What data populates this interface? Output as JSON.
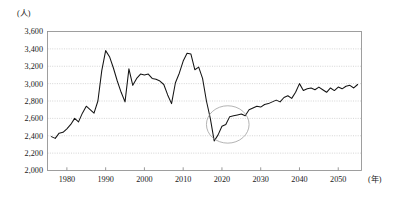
{
  "chart": {
    "y_axis_title": "(人)",
    "x_axis_title": "(年)"
  },
  "chart_data": {
    "type": "line",
    "title": "",
    "subtitle": "",
    "xlabel": "(年)",
    "ylabel": "(人)",
    "xlim": [
      1975,
      2056
    ],
    "ylim": [
      2000,
      3600
    ],
    "ytick_step": 200,
    "grid": true,
    "legend": false,
    "legend_position": "none",
    "ytick_labels": [
      "2,000",
      "2,200",
      "2,400",
      "2,600",
      "2,800",
      "3,000",
      "3,200",
      "3,400",
      "3,600"
    ],
    "ytick_values": [
      2000,
      2200,
      2400,
      2600,
      2800,
      3000,
      3200,
      3400,
      3600
    ],
    "xtick_labels": [
      "1980",
      "1990",
      "2000",
      "2010",
      "2020",
      "2030",
      "2040",
      "2050"
    ],
    "xtick_values": [
      1980,
      1990,
      2000,
      2010,
      2020,
      2030,
      2040,
      2050
    ],
    "series": [
      {
        "name": "人数",
        "color": "#141414",
        "x": [
          1976,
          1977,
          1978,
          1979,
          1980,
          1981,
          1982,
          1983,
          1984,
          1985,
          1986,
          1987,
          1988,
          1989,
          1990,
          1991,
          1992,
          1993,
          1994,
          1995,
          1996,
          1997,
          1998,
          1999,
          2000,
          2001,
          2002,
          2003,
          2004,
          2005,
          2006,
          2007,
          2008,
          2009,
          2010,
          2011,
          2012,
          2013,
          2014,
          2015,
          2016,
          2017,
          2018,
          2019,
          2020,
          2021,
          2022,
          2023,
          2024,
          2025,
          2026,
          2027,
          2028,
          2029,
          2030,
          2031,
          2032,
          2033,
          2034,
          2035,
          2036,
          2037,
          2038,
          2039,
          2040,
          2041,
          2042,
          2043,
          2044,
          2045,
          2046,
          2047,
          2048,
          2049,
          2050,
          2051,
          2052,
          2053,
          2054,
          2055
        ],
        "values": [
          2390,
          2370,
          2430,
          2440,
          2480,
          2530,
          2600,
          2560,
          2660,
          2740,
          2700,
          2660,
          2800,
          3150,
          3380,
          3310,
          3180,
          3030,
          2900,
          2790,
          3170,
          2980,
          3060,
          3110,
          3100,
          3110,
          3060,
          3050,
          3030,
          2990,
          2870,
          2770,
          3010,
          3120,
          3260,
          3350,
          3340,
          3160,
          3190,
          3060,
          2800,
          2600,
          2340,
          2410,
          2510,
          2530,
          2620,
          2630,
          2640,
          2650,
          2630,
          2700,
          2720,
          2740,
          2730,
          2760,
          2770,
          2790,
          2810,
          2790,
          2840,
          2860,
          2830,
          2900,
          3000,
          2920,
          2940,
          2950,
          2930,
          2960,
          2930,
          2900,
          2950,
          2920,
          2960,
          2940,
          2970,
          2980,
          2950,
          2990
        ]
      }
    ],
    "annotations": [
      {
        "type": "ellipse",
        "name": "trough-highlight-ellipse",
        "center_x": 2021.5,
        "center_y": 2530,
        "radius_x": 5.5,
        "radius_y": 215,
        "color": "#9a9a9a"
      }
    ]
  }
}
